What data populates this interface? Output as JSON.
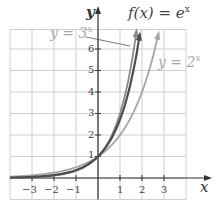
{
  "chart_data": {
    "type": "line",
    "title": "",
    "xlabel": "x",
    "ylabel": "y",
    "xlim": [
      -4,
      4
    ],
    "ylim": [
      -1,
      7
    ],
    "grid": true,
    "x_ticks": [
      "-3",
      "-2",
      "-1",
      "1",
      "2",
      "3"
    ],
    "y_ticks": [
      "1",
      "2",
      "3",
      "4",
      "5",
      "6"
    ],
    "series": [
      {
        "name": "f(x) = e^x",
        "function": "e^x",
        "color": "#4d4d4d",
        "x": [
          -4,
          -3,
          -2,
          -1,
          0,
          1,
          1.5,
          1.9
        ],
        "values": [
          0.018,
          0.05,
          0.135,
          0.368,
          1,
          2.718,
          4.48,
          6.69
        ]
      },
      {
        "name": "y = 3^x",
        "function": "3^x",
        "color": "#8a8a8a",
        "x": [
          -4,
          -3,
          -2,
          -1,
          0,
          1,
          1.5,
          1.75
        ],
        "values": [
          0.012,
          0.037,
          0.111,
          0.333,
          1,
          3,
          5.2,
          6.84
        ]
      },
      {
        "name": "y = 2^x",
        "function": "2^x",
        "color": "#a5a5a5",
        "x": [
          -4,
          -3,
          -2,
          -1,
          0,
          1,
          2,
          2.75
        ],
        "values": [
          0.0625,
          0.125,
          0.25,
          0.5,
          1,
          2,
          4,
          6.73
        ]
      }
    ],
    "annotations": [
      {
        "text": "f(x) = e^x",
        "position": "top"
      },
      {
        "text": "y = 3^x",
        "position": "top-left",
        "leader_line": true
      },
      {
        "text": "y = 2^x",
        "position": "right"
      }
    ]
  },
  "labels": {
    "y_axis": "y",
    "x_axis": "x",
    "ex_label_base": "f(x) = e",
    "ex_sup": "x",
    "three_label_base": "y = 3",
    "three_sup": "x",
    "two_label_base": "y = 2",
    "two_sup": "x"
  },
  "ticks": {
    "xm3": "−3",
    "xm2": "−2",
    "xm1": "−1",
    "x1": "1",
    "x2": "2",
    "x3": "3",
    "y1": "1",
    "y2": "2",
    "y3": "3",
    "y4": "4",
    "y5": "5",
    "y6": "6"
  }
}
